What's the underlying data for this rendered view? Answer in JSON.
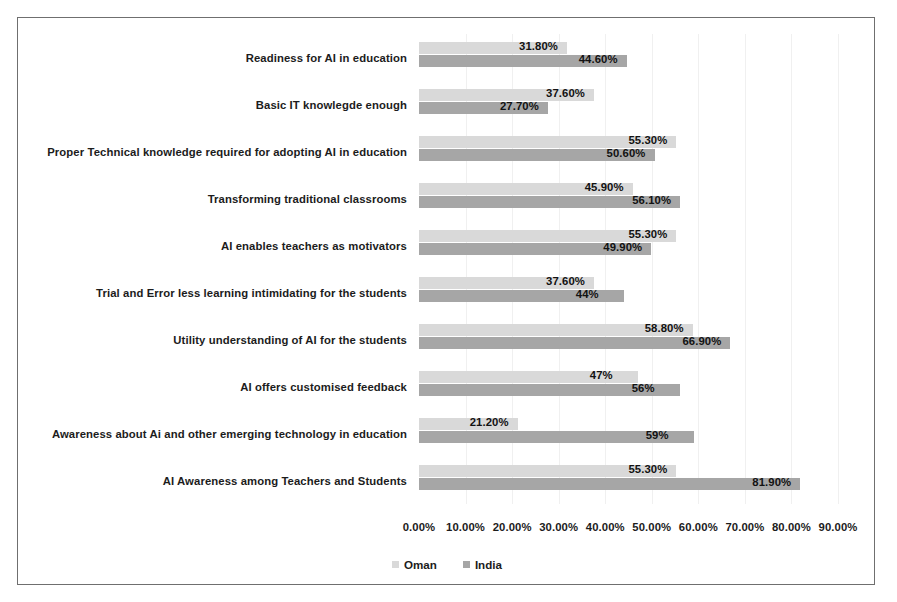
{
  "chart_data": {
    "type": "bar",
    "orientation": "horizontal",
    "title": "",
    "xlabel": "",
    "ylabel": "",
    "xlim": [
      0,
      90
    ],
    "grid": true,
    "legend_position": "bottom",
    "categories": [
      "Readiness for AI in education",
      "Basic IT knowlegde enough",
      "Proper Technical knowledge required for adopting AI in education",
      "Transforming traditional classrooms",
      "AI enables teachers as motivators",
      "Trial and Error less learning intimidating for the students",
      "Utility understanding of AI for the students",
      "AI offers customised feedback",
      "Awareness about Ai and other emerging technology in education",
      "AI Awareness among Teachers and Students"
    ],
    "series": [
      {
        "name": "Oman",
        "color": "#d9d9d9",
        "values": [
          31.8,
          37.6,
          55.3,
          45.9,
          55.3,
          37.6,
          58.8,
          47,
          21.2,
          55.3
        ],
        "labels": [
          "31.80%",
          "37.60%",
          "55.30%",
          "45.90%",
          "55.30%",
          "37.60%",
          "58.80%",
          "47%",
          "21.20%",
          "55.30%"
        ]
      },
      {
        "name": "India",
        "color": "#a6a6a6",
        "values": [
          44.6,
          27.7,
          50.6,
          56.1,
          49.9,
          44,
          66.9,
          56,
          59,
          81.9
        ],
        "labels": [
          "44.60%",
          "27.70%",
          "50.60%",
          "56.10%",
          "49.90%",
          "44%",
          "66.90%",
          "56%",
          "59%",
          "81.90%"
        ]
      }
    ],
    "tick_labels": [
      "0.00%",
      "10.00%",
      "20.00%",
      "30.00%",
      "40.00%",
      "50.00%",
      "60.00%",
      "70.00%",
      "80.00%",
      "90.00%"
    ],
    "tick_values": [
      0,
      10,
      20,
      30,
      40,
      50,
      60,
      70,
      80,
      90
    ]
  },
  "legend": {
    "items": [
      {
        "label": "Oman",
        "color": "#d9d9d9"
      },
      {
        "label": "India",
        "color": "#a6a6a6"
      }
    ]
  }
}
